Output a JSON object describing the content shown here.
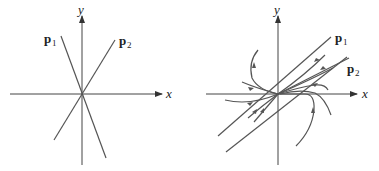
{
  "left_panel": {
    "x_label": "x",
    "y_label": "y",
    "p1_label": "p",
    "p1_sub": "1",
    "p2_label": "p",
    "p2_sub": "2"
  },
  "right_panel": {
    "x_label": "x",
    "y_label": "y",
    "p1_label": "p",
    "p1_sub": "1",
    "p2_label": "p",
    "p2_sub": "2"
  },
  "colors": {
    "line": "#555555",
    "axis": "#444444",
    "background": "#ffffff"
  }
}
